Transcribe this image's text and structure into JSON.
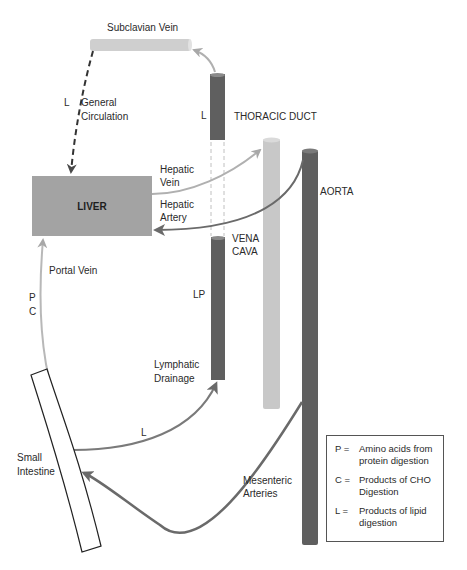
{
  "labels": {
    "subclavian_vein": "Subclavian Vein",
    "general_circulation_marker": "L",
    "general_circulation": [
      "General",
      "Circulation"
    ],
    "thoracic_duct_marker": "L",
    "thoracic_duct": "THORACIC DUCT",
    "hepatic_vein": [
      "Hepatic",
      "Vein"
    ],
    "hepatic_artery": [
      "Hepatic",
      "Artery"
    ],
    "liver": "LIVER",
    "aorta": "AORTA",
    "vena_cava": [
      "VENA",
      "CAVA"
    ],
    "portal_vein": "Portal Vein",
    "portal_markers": [
      "P",
      "C"
    ],
    "lymph_marker": "LP",
    "lymphatic_drainage": [
      "Lymphatic",
      "Drainage"
    ],
    "lipid_path_marker": "L",
    "small_intestine": [
      "Small",
      "Intestine"
    ],
    "mesenteric_arteries": [
      "Mesenteric",
      "Arteries"
    ]
  },
  "legend": [
    {
      "key": "P =",
      "desc": "Amino acids from protein digestion"
    },
    {
      "key": "C =",
      "desc": "Products of CHO Digestion"
    },
    {
      "key": "L =",
      "desc": "Products of lipid digestion"
    }
  ],
  "colors": {
    "dark_vessel": "#5f5f5f",
    "light_vessel": "#c8c8c8",
    "liver_fill": "#a3a3a3",
    "arrow_light": "#b0b0b0",
    "arrow_dark": "#6a6a6a"
  }
}
